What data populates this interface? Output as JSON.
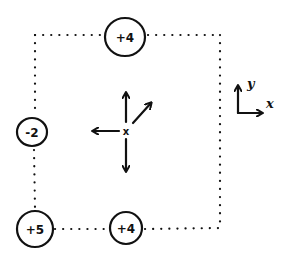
{
  "diagram": {
    "type": "hand-drawn force/charge diagram",
    "boundary": {
      "style": "dotted square",
      "corners": {
        "top_left": [
          35,
          35
        ],
        "top_right": [
          220,
          35
        ],
        "bottom_right": [
          220,
          228
        ],
        "bottom_left": [
          35,
          228
        ]
      }
    },
    "charges": [
      {
        "id": "top",
        "label": "+4",
        "cx": 125,
        "cy": 37,
        "rx": 20,
        "ry": 19
      },
      {
        "id": "left",
        "label": "-2",
        "cx": 32,
        "cy": 132,
        "rx": 15,
        "ry": 14
      },
      {
        "id": "bottom-left",
        "label": "+5",
        "cx": 35,
        "cy": 229,
        "rx": 18,
        "ry": 18
      },
      {
        "id": "bottom",
        "label": "+4",
        "cx": 126,
        "cy": 228,
        "rx": 16,
        "ry": 16
      }
    ],
    "center_point": {
      "marker": "x",
      "cx": 126,
      "cy": 131
    },
    "arrows": [
      {
        "direction": "up",
        "from": [
          126,
          122
        ],
        "to": [
          126,
          92
        ]
      },
      {
        "direction": "up-right",
        "from": [
          133,
          123
        ],
        "to": [
          152,
          102
        ]
      },
      {
        "direction": "left",
        "from": [
          119,
          131
        ],
        "to": [
          92,
          131
        ]
      },
      {
        "direction": "down",
        "from": [
          126,
          139
        ],
        "to": [
          126,
          172
        ]
      }
    ],
    "axes": {
      "origin": [
        238,
        113
      ],
      "x_label": "x",
      "y_label": "y"
    }
  },
  "colors": {
    "ink": "#111111",
    "background": "#ffffff"
  }
}
